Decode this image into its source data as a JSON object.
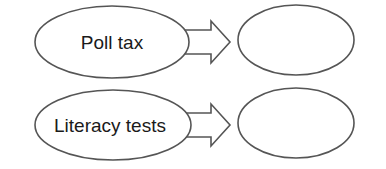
{
  "diagram": {
    "rows": [
      {
        "cause": "Poll tax",
        "effect": ""
      },
      {
        "cause": "Literacy tests",
        "effect": ""
      }
    ],
    "colors": {
      "stroke": "#555555",
      "text": "#1a1a1a",
      "background": "#ffffff"
    }
  }
}
